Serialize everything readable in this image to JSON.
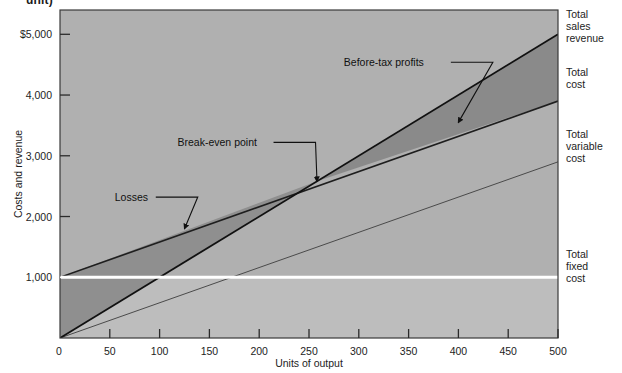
{
  "figure": {
    "cut_off_heading": "unit)",
    "background_color": "#ffffff",
    "plot_background_color": "#b0b0b0",
    "fixed_cost_band_color": "#bdbdbd",
    "loss_wedge_color": "#8f8f8f",
    "profit_wedge_color": "#8a8a8a",
    "frame_color": "#3a3a3a",
    "fixed_cost_line_color": "#ffffff"
  },
  "chart_data": {
    "type": "line",
    "title": "",
    "xlabel": "Units of output",
    "ylabel": "Costs and revenue",
    "xlim": [
      0,
      500
    ],
    "ylim": [
      0,
      5400
    ],
    "xticks": [
      0,
      50,
      100,
      150,
      200,
      250,
      300,
      350,
      400,
      450,
      500
    ],
    "xticklabels": [
      "0",
      "50",
      "100",
      "150",
      "200",
      "250",
      "300",
      "350",
      "400",
      "450",
      "500"
    ],
    "yticks": [
      1000,
      2000,
      3000,
      4000,
      5000
    ],
    "yticklabels": [
      "1,000",
      "2,000",
      "3,000",
      "4,000",
      "$5,000"
    ],
    "y_zero_label": "0",
    "grid": false,
    "legend_position": "right-outside",
    "series": [
      {
        "name": "Total sales revenue",
        "points": [
          [
            0,
            0
          ],
          [
            500,
            5000
          ]
        ],
        "style": "solid-thick-dark"
      },
      {
        "name": "Total cost",
        "points": [
          [
            0,
            1000
          ],
          [
            500,
            3900
          ]
        ],
        "style": "solid-thick-dark"
      },
      {
        "name": "Total variable cost",
        "points": [
          [
            0,
            0
          ],
          [
            500,
            2900
          ]
        ],
        "style": "solid-thin-dark"
      },
      {
        "name": "Total fixed cost",
        "points": [
          [
            0,
            1000
          ],
          [
            500,
            1000
          ]
        ],
        "style": "solid-thick-white"
      }
    ],
    "regions": [
      {
        "name": "Losses",
        "description": "Area between total cost and total sales revenue left of break-even point"
      },
      {
        "name": "Before-tax profits",
        "description": "Area between total sales revenue and total cost right of break-even point"
      }
    ],
    "annotations": [
      {
        "label": "Before-tax profits",
        "target_xy": [
          400,
          3550
        ],
        "label_xy": [
          285,
          4540
        ]
      },
      {
        "label": "Break-even point",
        "target_xy": [
          258,
          2580
        ],
        "label_xy": [
          118,
          3220
        ]
      },
      {
        "label": "Losses",
        "target_xy": [
          125,
          1800
        ],
        "label_xy": [
          55,
          2320
        ]
      }
    ],
    "break_even": {
      "units": 258,
      "value": 2580
    }
  },
  "right_labels": [
    {
      "name": "total-sales-revenue",
      "lines": [
        "Total",
        "sales",
        "revenue"
      ]
    },
    {
      "name": "total-cost",
      "lines": [
        "Total",
        "cost"
      ]
    },
    {
      "name": "total-variable-cost",
      "lines": [
        "Total",
        "variable",
        "cost"
      ]
    },
    {
      "name": "total-fixed-cost",
      "lines": [
        "Total",
        "fixed",
        "cost"
      ]
    }
  ]
}
